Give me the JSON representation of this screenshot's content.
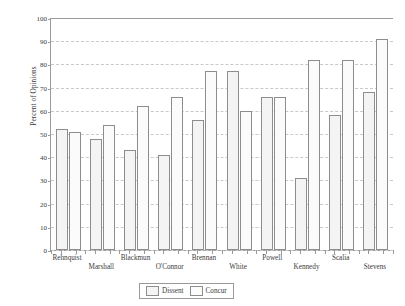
{
  "chart_data": {
    "type": "bar",
    "title": "",
    "xlabel": "",
    "ylabel": "Percent of Opinions",
    "ylim": [
      0,
      100
    ],
    "yticks": [
      0,
      10,
      20,
      30,
      40,
      50,
      60,
      70,
      80,
      90,
      100
    ],
    "grid": true,
    "legend_position": "bottom-center",
    "categories": [
      "Rehnquist",
      "Marshall",
      "Blackmun",
      "O'Connor",
      "Brennan",
      "White",
      "Powell",
      "Kennedy",
      "Scalia",
      "Stevens"
    ],
    "series": [
      {
        "name": "Dissent",
        "values": [
          52,
          48,
          43,
          41,
          56,
          77,
          66,
          31,
          58,
          68
        ]
      },
      {
        "name": "Concur",
        "values": [
          51,
          54,
          62,
          66,
          77,
          60,
          66,
          82,
          82,
          91
        ]
      }
    ]
  },
  "legend": {
    "items": [
      {
        "label": "Dissent",
        "key": "dissent"
      },
      {
        "label": "Concur",
        "key": "concur"
      }
    ]
  },
  "colors": {
    "axis": "#9a9a9a",
    "grid": "#c9c9c9",
    "bar_dissent_fill": "#f4f4f4",
    "bar_concur_fill": "#fbfbfb",
    "bar_edge": "#8d8d8d",
    "text": "#3a3a3a",
    "background": "#ffffff"
  }
}
